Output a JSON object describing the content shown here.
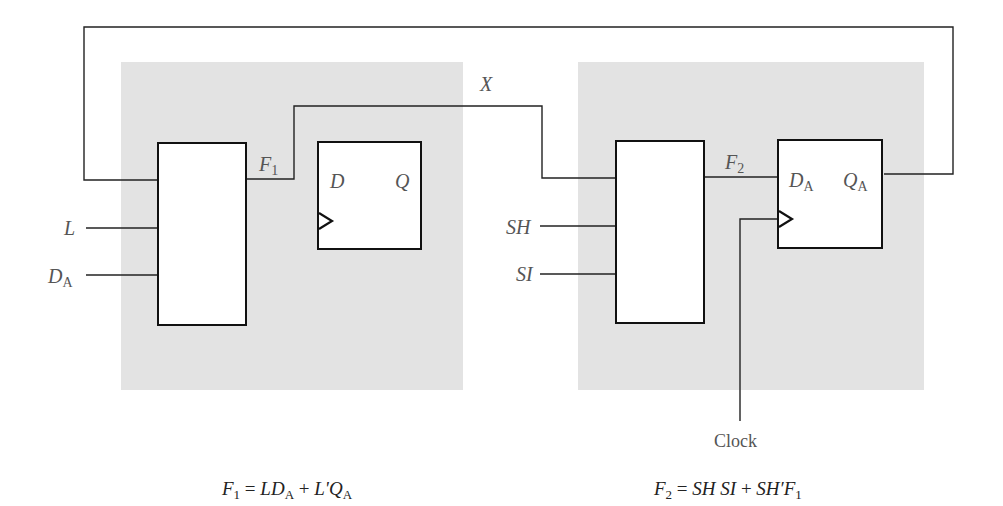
{
  "diagram": {
    "left_cell": {
      "inputs": [
        {
          "name": "L",
          "label": "L"
        },
        {
          "name": "DA",
          "label": "D",
          "sub": "A"
        }
      ],
      "mux_output": {
        "label": "F",
        "sub": "1"
      },
      "flipflop": {
        "d_label": "D",
        "q_label": "Q"
      },
      "equation": {
        "lhs": "F",
        "lhs_sub": "1",
        "parts": [
          "L",
          "D",
          "A",
          "+",
          "L'",
          "Q",
          "A"
        ],
        "text": "F1 = LDA + L'QA"
      }
    },
    "right_cell": {
      "inputs": [
        {
          "name": "SH",
          "label": "SH"
        },
        {
          "name": "SI",
          "label": "SI"
        }
      ],
      "mux_output": {
        "label": "F",
        "sub": "2"
      },
      "flipflop": {
        "d_label": "D",
        "d_sub": "A",
        "q_label": "Q",
        "q_sub": "A"
      },
      "clock_label": "Clock",
      "equation": {
        "lhs": "F",
        "lhs_sub": "2",
        "text": "F2 = SH SI + SH'F1"
      }
    },
    "wire_labels": {
      "x": "X"
    },
    "colors": {
      "panel": "#e3e3e3",
      "wire": "#222222",
      "box_border": "#111111",
      "label": "#555555"
    }
  }
}
